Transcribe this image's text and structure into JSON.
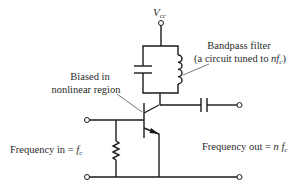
{
  "diagram": {
    "supply": {
      "label_main": "V",
      "label_sub": "cc"
    },
    "labels": {
      "bias_line1": "Biased in",
      "bias_line2": "nonlinear region",
      "filter_line1": "Bandpass filter",
      "filter_line2_prefix": "(a circuit tuned to ",
      "filter_line2_var": "nf",
      "filter_line2_sub": "c",
      "filter_line2_suffix": ")",
      "input_prefix": "Frequency in = ",
      "input_var": "f",
      "input_sub": "c",
      "output_prefix": "Frequency out = ",
      "output_var": "n f",
      "output_sub": "c"
    },
    "components": [
      {
        "type": "dc-supply-terminal",
        "name": "Vcc"
      },
      {
        "type": "capacitor",
        "role": "tank capacitor"
      },
      {
        "type": "inductor",
        "role": "tank inductor"
      },
      {
        "type": "npn-transistor",
        "role": "multiplier"
      },
      {
        "type": "resistor",
        "role": "base bias"
      },
      {
        "type": "capacitor",
        "role": "output coupling"
      },
      {
        "type": "terminal",
        "role": "input"
      },
      {
        "type": "terminal",
        "role": "output"
      },
      {
        "type": "terminal",
        "role": "ground-input"
      },
      {
        "type": "terminal",
        "role": "ground-output"
      }
    ],
    "colors": {
      "ink": "#1a1a1a",
      "text": "#2a2a2a",
      "background": "#ffffff"
    }
  }
}
